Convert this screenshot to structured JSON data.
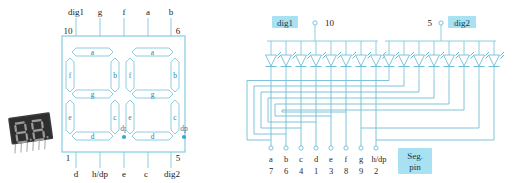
{
  "figure": {
    "colors": {
      "wire": "#7fc8de",
      "highlight_bg": "#a8e2f2",
      "text": "#1a1a1a",
      "dp_dot": "#3aa8d0"
    }
  },
  "photo": {
    "name": "dual-seven-segment-display-photo",
    "caption": "two-digit seven segment LED module"
  },
  "left_diagram": {
    "name": "package-pinout",
    "top_labels": [
      "dig1",
      "g",
      "f",
      "a",
      "b"
    ],
    "top_pin_numbers": [
      "10",
      "6"
    ],
    "bottom_labels": [
      "d",
      "h/dp",
      "e",
      "c",
      "dig2"
    ],
    "bottom_pin_numbers": [
      "1",
      "5"
    ],
    "digit1_segments": [
      "a",
      "b",
      "c",
      "d",
      "e",
      "f",
      "g"
    ],
    "digit1_dp": "dp",
    "digit2_segments": [
      "a",
      "b",
      "c",
      "d",
      "e",
      "f",
      "g"
    ],
    "digit2_dp": "dp"
  },
  "right_diagram": {
    "name": "internal-led-schematic",
    "dig1": {
      "label": "dig1",
      "pin": "10"
    },
    "dig2": {
      "label": "dig2",
      "pin": "5"
    },
    "seg_pin_box": {
      "line1": "Seg.",
      "line2": "pin"
    },
    "segment_pins": [
      {
        "seg": "a",
        "pin": "7"
      },
      {
        "seg": "b",
        "pin": "6"
      },
      {
        "seg": "c",
        "pin": "4"
      },
      {
        "seg": "d",
        "pin": "1"
      },
      {
        "seg": "e",
        "pin": "3"
      },
      {
        "seg": "f",
        "pin": "8"
      },
      {
        "seg": "g",
        "pin": "9"
      },
      {
        "seg": "h/dp",
        "pin": "2"
      }
    ],
    "leds_per_digit": 8,
    "digit_count": 2
  }
}
